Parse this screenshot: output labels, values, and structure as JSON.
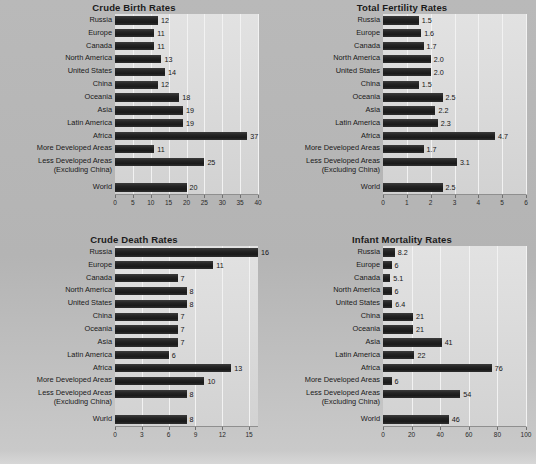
{
  "figure": {
    "background_color": "#b6b6b6",
    "panel_color": "#dcdcdc",
    "bar_color": "#1f1f1f",
    "grid_color": "#f2f2f2"
  },
  "chart_data": [
    {
      "type": "bar",
      "orientation": "horizontal",
      "title": "Crude Birth Rates",
      "xlabel": "",
      "ylabel": "",
      "xlim": [
        0,
        40
      ],
      "ticks": [
        "0",
        "5",
        "10",
        "15",
        "20",
        "25",
        "30",
        "35",
        "40"
      ],
      "tick_values": [
        0,
        5,
        10,
        15,
        20,
        25,
        30,
        35,
        40
      ],
      "grid": true,
      "legend": "none",
      "categories": [
        "Russia",
        "Europe",
        "Canada",
        "North America",
        "United States",
        "China",
        "Oceania",
        "Asia",
        "Latin America",
        "Africa",
        "More Developed Areas",
        "Less Developed Areas\n(Excluding China)",
        "World"
      ],
      "values": [
        12,
        11,
        11,
        13,
        14,
        12,
        18,
        19,
        19,
        37,
        11,
        25,
        20
      ],
      "labels": [
        "12",
        "11",
        "11",
        "13",
        "14",
        "12",
        "18",
        "19",
        "19",
        "37",
        "11",
        "25",
        "20"
      ]
    },
    {
      "type": "bar",
      "orientation": "horizontal",
      "title": "Total Fertility Rates",
      "xlabel": "",
      "ylabel": "",
      "xlim": [
        0,
        6
      ],
      "ticks": [
        "0",
        "1",
        "2",
        "3",
        "4",
        "5",
        "6"
      ],
      "tick_values": [
        0,
        1,
        2,
        3,
        4,
        5,
        6
      ],
      "grid": true,
      "legend": "none",
      "categories": [
        "Russia",
        "Europe",
        "Canada",
        "North America",
        "United States",
        "China",
        "Oceania",
        "Asia",
        "Latin America",
        "Africa",
        "More Developed Areas",
        "Less Developed Areas\n(Excluding China)",
        "World"
      ],
      "values": [
        1.5,
        1.6,
        1.7,
        2.0,
        2.0,
        1.5,
        2.5,
        2.2,
        2.3,
        4.7,
        1.7,
        3.1,
        2.5
      ],
      "labels": [
        "1.5",
        "1.6",
        "1.7",
        "2.0",
        "2.0",
        "1.5",
        "2.5",
        "2.2",
        "2.3",
        "4.7",
        "1.7",
        "3.1",
        "2.5"
      ]
    },
    {
      "type": "bar",
      "orientation": "horizontal",
      "title": "Crude Death Rates",
      "xlabel": "",
      "ylabel": "",
      "xlim": [
        0,
        16
      ],
      "ticks": [
        "0",
        "3",
        "6",
        "9",
        "12",
        "15"
      ],
      "tick_values": [
        0,
        3,
        6,
        9,
        12,
        15
      ],
      "grid": true,
      "legend": "none",
      "categories": [
        "Russia",
        "Europe",
        "Canada",
        "North America",
        "United States",
        "China",
        "Oceania",
        "Asia",
        "Latin America",
        "Africa",
        "More Developed Areas",
        "Less Developed Areas\n(Excluding China)",
        "Wurld"
      ],
      "values": [
        16,
        11,
        7,
        8,
        8,
        7,
        7,
        7,
        6,
        13,
        10,
        8,
        8
      ],
      "labels": [
        "16",
        "11",
        "7",
        "8",
        "8",
        "7",
        "7",
        "7",
        "6",
        "13",
        "10",
        "8",
        "8"
      ]
    },
    {
      "type": "bar",
      "orientation": "horizontal",
      "title": "Infant Mortality Rates",
      "xlabel": "",
      "ylabel": "",
      "xlim": [
        0,
        100
      ],
      "ticks": [
        "0",
        "20",
        "40",
        "60",
        "80",
        "100"
      ],
      "tick_values": [
        0,
        20,
        40,
        60,
        80,
        100
      ],
      "grid": true,
      "legend": "none",
      "categories": [
        "Russia",
        "Europe",
        "Canada",
        "North America",
        "United States",
        "China",
        "Oceania",
        "Asia",
        "Latin America",
        "Africa",
        "More Developed Areas",
        "Less Developed Areas\n(Excluding China)",
        "World"
      ],
      "values": [
        8.2,
        6,
        5.1,
        6,
        6.4,
        21,
        21,
        41,
        22,
        76,
        6,
        54,
        46
      ],
      "labels": [
        "8.2",
        "6",
        "5.1",
        "6",
        "6.4",
        "21",
        "21",
        "41",
        "22",
        "76",
        "6",
        "54",
        "46"
      ]
    }
  ]
}
